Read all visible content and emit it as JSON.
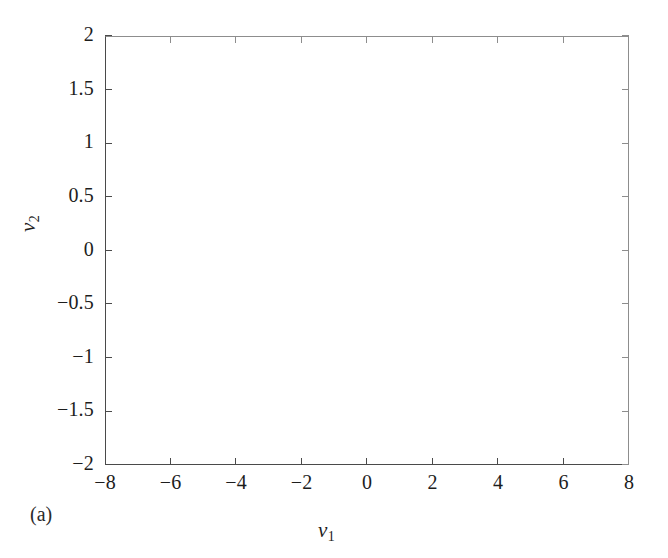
{
  "figure": {
    "panel_label": "(a)",
    "background_color": "#ffffff",
    "axis_color": "#4a4a4a",
    "trace_color": "#1a1a1a"
  },
  "chart_data": {
    "type": "line",
    "title": "",
    "subtitle": "",
    "xlabel": "v1",
    "xlabel_text": "v",
    "xlabel_sub": "1",
    "ylabel": "v2",
    "ylabel_text": "v",
    "ylabel_sub": "2",
    "grid": false,
    "legend": "none",
    "xlim": [
      -8,
      8
    ],
    "ylim": [
      -2,
      2
    ],
    "xticks": [
      -8,
      -6,
      -4,
      -2,
      0,
      2,
      4,
      6,
      8
    ],
    "xticklabels": [
      "-8",
      "-6",
      "-4",
      "-2",
      "0",
      "2",
      "4",
      "6",
      "8"
    ],
    "yticks": [
      -2,
      -1.5,
      -1,
      -0.5,
      0,
      0.5,
      1,
      1.5,
      2
    ],
    "yticklabels": [
      "-2",
      "-1.5",
      "-1",
      "-0.5",
      "0",
      "0.5",
      "1",
      "1.5",
      "2"
    ],
    "series": [
      {
        "name": "trajectory",
        "style": "solid thin black line, single continuous orbit",
        "point_count": 60000,
        "color": "#1a1a1a",
        "linewidth": 0.35
      }
    ],
    "attractor": {
      "model": "double-scroll",
      "left_focus": [
        -2.55,
        -0.12
      ],
      "right_focus": [
        2.55,
        0.12
      ],
      "x_extent": [
        -6.05,
        6.6
      ],
      "y_extent": [
        -1.58,
        1.53
      ],
      "tilt_slope": 0.22,
      "outer_lobe_radius_x": 3.6,
      "outer_lobe_radius_y": 1.48,
      "inner_core_radius_x": 0.18,
      "inner_core_radius_y": 0.07,
      "spiral_turns": 34,
      "lobe_switches": 86
    }
  }
}
